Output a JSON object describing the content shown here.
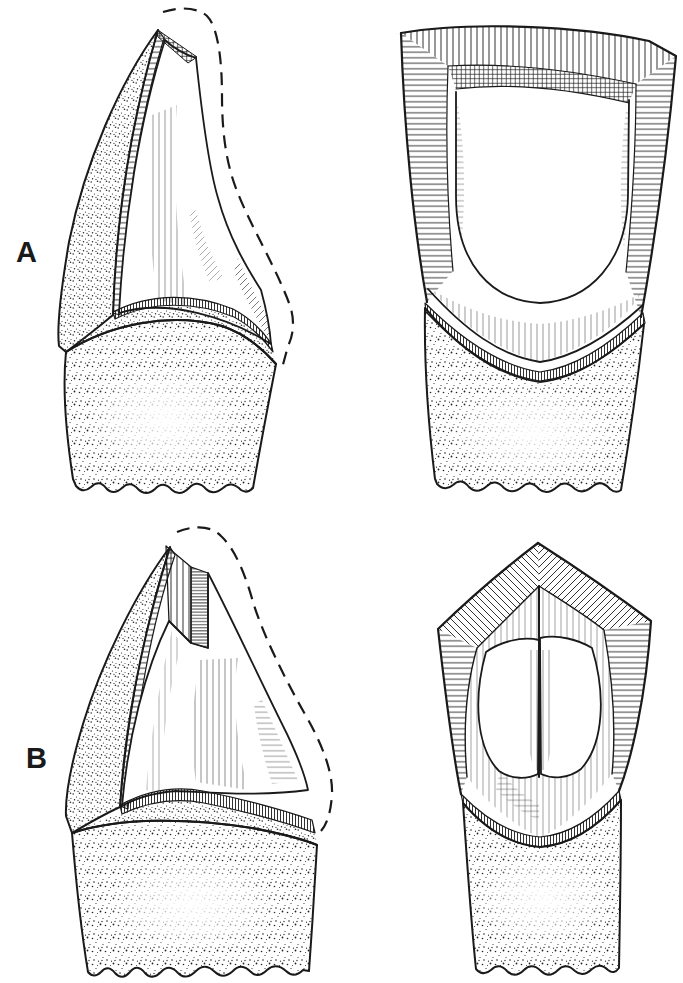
{
  "figure": {
    "labels": {
      "panel_a": "A",
      "panel_b": "B"
    },
    "colors": {
      "background": "#ffffff",
      "ink": "#1a1a1a"
    }
  }
}
